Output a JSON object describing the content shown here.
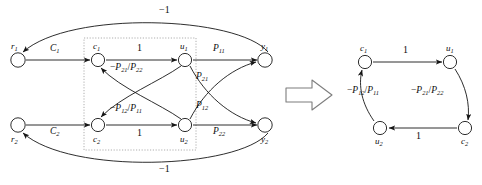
{
  "figure": {
    "transform_symbol": "double-right-arrow",
    "left_graph": {
      "nodes": [
        {
          "id": "r1",
          "label": "r",
          "sub": "1",
          "x": 18,
          "y": 60,
          "label_pos": "above-left"
        },
        {
          "id": "r2",
          "label": "r",
          "sub": "2",
          "x": 18,
          "y": 125,
          "label_pos": "below-left"
        },
        {
          "id": "c1",
          "label": "c",
          "sub": "1",
          "x": 98,
          "y": 60,
          "label_pos": "above"
        },
        {
          "id": "c2",
          "label": "c",
          "sub": "2",
          "x": 98,
          "y": 125,
          "label_pos": "below"
        },
        {
          "id": "u1",
          "label": "u",
          "sub": "1",
          "x": 185,
          "y": 60,
          "label_pos": "above"
        },
        {
          "id": "u2",
          "label": "u",
          "sub": "2",
          "x": 185,
          "y": 125,
          "label_pos": "below"
        },
        {
          "id": "y1",
          "label": "y",
          "sub": "1",
          "x": 265,
          "y": 60,
          "label_pos": "above-right"
        },
        {
          "id": "y2",
          "label": "y",
          "sub": "2",
          "x": 265,
          "y": 125,
          "label_pos": "below-right"
        }
      ],
      "edges": [
        {
          "from": "r1",
          "to": "c1",
          "gain": "C",
          "gain_sub": "1",
          "x": 56,
          "y": 48
        },
        {
          "from": "r2",
          "to": "c2",
          "gain": "C",
          "gain_sub": "2",
          "x": 56,
          "y": 131
        },
        {
          "from": "c1",
          "to": "u1",
          "gain": "1",
          "gain_sub": "",
          "x": 138,
          "y": 48
        },
        {
          "from": "c2",
          "to": "u2",
          "gain": "1",
          "gain_sub": "",
          "x": 138,
          "y": 133
        },
        {
          "from": "u1",
          "to": "y1",
          "gain": "P",
          "gain_sub": "11",
          "x": 218,
          "y": 48
        },
        {
          "from": "u2",
          "to": "y2",
          "gain": "P",
          "gain_sub": "22",
          "x": 218,
          "y": 133
        },
        {
          "from": "u1",
          "to": "y2",
          "gain": "P",
          "gain_sub": "21",
          "x": 196,
          "y": 78
        },
        {
          "from": "u2",
          "to": "y1",
          "gain": "P",
          "gain_sub": "12",
          "x": 196,
          "y": 105
        },
        {
          "from": "u2",
          "to": "c1",
          "gain": "-P21/P22",
          "gain_sub": "",
          "x": 113,
          "y": 66
        },
        {
          "from": "u1",
          "to": "c2",
          "gain": "-P12/P11",
          "gain_sub": "",
          "x": 113,
          "y": 108
        },
        {
          "from": "y1",
          "to": "r1",
          "gain": "-1",
          "gain_sub": "",
          "x": 160,
          "y": 7
        },
        {
          "from": "y2",
          "to": "r2",
          "gain": "-1",
          "gain_sub": "",
          "x": 160,
          "y": 167
        }
      ],
      "dotted_box": {
        "x": 84,
        "y": 38,
        "width": 112,
        "height": 112
      }
    },
    "right_graph": {
      "nodes": [
        {
          "id": "c1",
          "label": "c",
          "sub": "1",
          "x": 365,
          "y": 62,
          "label_pos": "above"
        },
        {
          "id": "u1",
          "label": "u",
          "sub": "1",
          "x": 450,
          "y": 62,
          "label_pos": "above"
        },
        {
          "id": "c2",
          "label": "c",
          "sub": "2",
          "x": 465,
          "y": 128,
          "label_pos": "below"
        },
        {
          "id": "u2",
          "label": "u",
          "sub": "2",
          "x": 380,
          "y": 128,
          "label_pos": "below"
        }
      ],
      "edges": [
        {
          "from": "c1",
          "to": "u1",
          "gain": "1",
          "x": 404,
          "y": 50
        },
        {
          "from": "u1",
          "to": "c2",
          "gain": "-P21/P22",
          "x": 427,
          "y": 90
        },
        {
          "from": "c2",
          "to": "u2",
          "gain": "1",
          "x": 419,
          "y": 137
        },
        {
          "from": "u2",
          "to": "c1",
          "gain": "-P12/P11",
          "x": 363,
          "y": 90
        }
      ]
    },
    "labels": {
      "minus_one": "−1",
      "one": "1",
      "minus_sign": "−",
      "slash": "/",
      "C": "C",
      "P": "P",
      "r": "r",
      "c": "c",
      "u": "u",
      "y": "y",
      "sub1": "1",
      "sub2": "2",
      "sub11": "11",
      "sub12": "12",
      "sub21": "21",
      "sub22": "22"
    },
    "colors": {
      "stroke": "#161616",
      "node_fill": "#ffffff",
      "dotted": "#8a8a8a",
      "arrow_outline": "#6e6e6e",
      "background": "#ffffff"
    }
  }
}
